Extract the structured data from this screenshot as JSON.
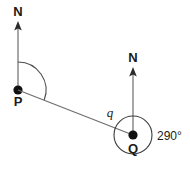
{
  "figure": {
    "type": "bearing-diagram",
    "background_color": "#ffffff",
    "line_color": "#6e6e6e",
    "text_color": "#1a1a1a",
    "points": [
      {
        "id": "P",
        "label": "P",
        "north_label": "N",
        "x": 18,
        "y": 90,
        "label_x": 18,
        "label_y": 106,
        "north_label_x": 18,
        "north_label_y": 16,
        "north_line_top_y": 22,
        "arc_radius": 28,
        "has_arc": true,
        "has_circle": false
      },
      {
        "id": "Q",
        "label": "Q",
        "north_label": "N",
        "x": 133,
        "y": 135,
        "label_x": 133,
        "label_y": 152,
        "north_label_x": 133,
        "north_label_y": 62,
        "north_line_top_y": 68,
        "circle_radius": 19,
        "has_arc": false,
        "has_circle": true
      }
    ],
    "segment": {
      "name": "PQ",
      "from": "P",
      "to": "Q",
      "x1": 18,
      "y1": 90,
      "x2": 133,
      "y2": 135
    },
    "annotations": [
      {
        "id": "angle-q",
        "text": "q",
        "italic": true,
        "x": 113,
        "y": 116
      },
      {
        "id": "angle-290",
        "text": "290°",
        "italic": false,
        "x": 158,
        "y": 140
      }
    ]
  }
}
